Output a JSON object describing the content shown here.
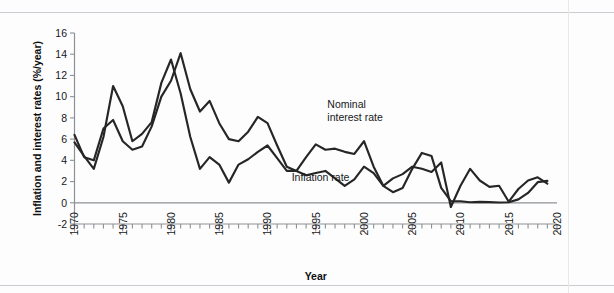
{
  "figure": {
    "background": "#fdfdfd",
    "line_color": "#262626",
    "axis_color": "#8d9196",
    "rule_color": "#c9ccd1"
  },
  "chart_data": {
    "type": "line",
    "title": "",
    "xlabel": "Year",
    "ylabel": "Inflation and interest rates (%/year)",
    "xlim": [
      1970,
      2020
    ],
    "ylim": [
      -2,
      16
    ],
    "yticks": [
      -2,
      0,
      2,
      4,
      6,
      8,
      10,
      12,
      14,
      16
    ],
    "ytick_labels": [
      "-2",
      "0",
      "2",
      "4",
      "6",
      "8",
      "10",
      "12",
      "14",
      "16"
    ],
    "xticks": [
      1970,
      1971,
      1972,
      1973,
      1974,
      1975,
      1976,
      1977,
      1978,
      1979,
      1980,
      1981,
      1982,
      1983,
      1984,
      1985,
      1986,
      1987,
      1988,
      1989,
      1990,
      1991,
      1992,
      1993,
      1994,
      1995,
      1996,
      1997,
      1998,
      1999,
      2000,
      2001,
      2002,
      2003,
      2004,
      2005,
      2006,
      2007,
      2008,
      2009,
      2010,
      2011,
      2012,
      2013,
      2014,
      2015,
      2016,
      2017,
      2018,
      2019,
      2020
    ],
    "xtick_labels_major": [
      "1970",
      "1975",
      "1980",
      "1985",
      "1990",
      "1995",
      "2000",
      "2005",
      "2010",
      "2015",
      "2020"
    ],
    "xtick_major_values": [
      1970,
      1975,
      1980,
      1985,
      1990,
      1995,
      2000,
      2005,
      2010,
      2015,
      2020
    ],
    "grid": false,
    "legend_position": "inline-annotations",
    "zero_line": 0,
    "x": [
      1970,
      1971,
      1972,
      1973,
      1974,
      1975,
      1976,
      1977,
      1978,
      1979,
      1980,
      1981,
      1982,
      1983,
      1984,
      1985,
      1986,
      1987,
      1988,
      1989,
      1990,
      1991,
      1992,
      1993,
      1994,
      1995,
      1996,
      1997,
      1998,
      1999,
      2000,
      2001,
      2002,
      2003,
      2004,
      2005,
      2006,
      2007,
      2008,
      2009,
      2010,
      2011,
      2012,
      2013,
      2014,
      2015,
      2016,
      2017,
      2018,
      2019
    ],
    "series": [
      {
        "name": "Nominal interest rate",
        "label": "Nominal\ninterest rate",
        "values": [
          6.4,
          4.3,
          4.0,
          7.0,
          7.8,
          5.8,
          5.0,
          5.3,
          7.2,
          10.0,
          11.5,
          14.1,
          10.7,
          8.6,
          9.6,
          7.5,
          6.0,
          5.8,
          6.7,
          8.1,
          7.5,
          5.4,
          3.4,
          3.0,
          4.3,
          5.5,
          5.0,
          5.1,
          4.8,
          4.6,
          5.8,
          3.4,
          1.6,
          1.0,
          1.4,
          3.2,
          4.7,
          4.4,
          1.4,
          0.15,
          0.14,
          0.05,
          0.09,
          0.06,
          0.03,
          0.05,
          0.32,
          0.93,
          1.94,
          2.06
        ],
        "points": [
          {
            "x": 1970,
            "y": 6.4
          },
          {
            "x": 1971,
            "y": 4.3
          },
          {
            "x": 1972,
            "y": 4.0
          },
          {
            "x": 1973,
            "y": 7.0
          },
          {
            "x": 1974,
            "y": 7.8
          },
          {
            "x": 1975,
            "y": 5.8
          },
          {
            "x": 1976,
            "y": 5.0
          },
          {
            "x": 1977,
            "y": 5.3
          },
          {
            "x": 1978,
            "y": 7.2
          },
          {
            "x": 1979,
            "y": 10.0
          },
          {
            "x": 1980,
            "y": 11.5
          },
          {
            "x": 1981,
            "y": 14.1
          },
          {
            "x": 1982,
            "y": 10.7
          },
          {
            "x": 1983,
            "y": 8.6
          },
          {
            "x": 1984,
            "y": 9.6
          },
          {
            "x": 1985,
            "y": 7.5
          },
          {
            "x": 1986,
            "y": 6.0
          },
          {
            "x": 1987,
            "y": 5.8
          },
          {
            "x": 1988,
            "y": 6.7
          },
          {
            "x": 1989,
            "y": 8.1
          },
          {
            "x": 1990,
            "y": 7.5
          },
          {
            "x": 1991,
            "y": 5.4
          },
          {
            "x": 1992,
            "y": 3.4
          },
          {
            "x": 1993,
            "y": 3.0
          },
          {
            "x": 1994,
            "y": 4.3
          },
          {
            "x": 1995,
            "y": 5.5
          },
          {
            "x": 1996,
            "y": 5.0
          },
          {
            "x": 1997,
            "y": 5.1
          },
          {
            "x": 1998,
            "y": 4.8
          },
          {
            "x": 1999,
            "y": 4.6
          },
          {
            "x": 2000,
            "y": 5.8
          },
          {
            "x": 2001,
            "y": 3.4
          },
          {
            "x": 2002,
            "y": 1.6
          },
          {
            "x": 2003,
            "y": 1.0
          },
          {
            "x": 2004,
            "y": 1.4
          },
          {
            "x": 2005,
            "y": 3.2
          },
          {
            "x": 2006,
            "y": 4.7
          },
          {
            "x": 2007,
            "y": 4.4
          },
          {
            "x": 2008,
            "y": 1.4
          },
          {
            "x": 2009,
            "y": 0.15
          },
          {
            "x": 2010,
            "y": 0.14
          },
          {
            "x": 2011,
            "y": 0.05
          },
          {
            "x": 2012,
            "y": 0.09
          },
          {
            "x": 2013,
            "y": 0.06
          },
          {
            "x": 2014,
            "y": 0.03
          },
          {
            "x": 2015,
            "y": 0.05
          },
          {
            "x": 2016,
            "y": 0.32
          },
          {
            "x": 2017,
            "y": 0.93
          },
          {
            "x": 2018,
            "y": 1.94
          },
          {
            "x": 2019,
            "y": 2.06
          }
        ]
      },
      {
        "name": "Inflation rate",
        "label": "Inflation rate",
        "values": [
          5.7,
          4.4,
          3.2,
          6.2,
          11.0,
          9.1,
          5.8,
          6.5,
          7.6,
          11.3,
          13.5,
          10.3,
          6.2,
          3.2,
          4.3,
          3.6,
          1.9,
          3.6,
          4.1,
          4.8,
          5.4,
          4.2,
          3.0,
          3.0,
          2.6,
          2.8,
          3.0,
          2.3,
          1.6,
          2.2,
          3.4,
          2.8,
          1.6,
          2.3,
          2.7,
          3.4,
          3.2,
          2.9,
          3.8,
          -0.4,
          1.6,
          3.2,
          2.1,
          1.5,
          1.6,
          0.1,
          1.3,
          2.1,
          2.4,
          1.8
        ],
        "points": [
          {
            "x": 1970,
            "y": 5.7
          },
          {
            "x": 1971,
            "y": 4.4
          },
          {
            "x": 1972,
            "y": 3.2
          },
          {
            "x": 1973,
            "y": 6.2
          },
          {
            "x": 1974,
            "y": 11.0
          },
          {
            "x": 1975,
            "y": 9.1
          },
          {
            "x": 1976,
            "y": 5.8
          },
          {
            "x": 1977,
            "y": 6.5
          },
          {
            "x": 1978,
            "y": 7.6
          },
          {
            "x": 1979,
            "y": 11.3
          },
          {
            "x": 1980,
            "y": 13.5
          },
          {
            "x": 1981,
            "y": 10.3
          },
          {
            "x": 1982,
            "y": 6.2
          },
          {
            "x": 1983,
            "y": 3.2
          },
          {
            "x": 1984,
            "y": 4.3
          },
          {
            "x": 1985,
            "y": 3.6
          },
          {
            "x": 1986,
            "y": 1.9
          },
          {
            "x": 1987,
            "y": 3.6
          },
          {
            "x": 1988,
            "y": 4.1
          },
          {
            "x": 1989,
            "y": 4.8
          },
          {
            "x": 1990,
            "y": 5.4
          },
          {
            "x": 1991,
            "y": 4.2
          },
          {
            "x": 1992,
            "y": 3.0
          },
          {
            "x": 1993,
            "y": 3.0
          },
          {
            "x": 1994,
            "y": 2.6
          },
          {
            "x": 1995,
            "y": 2.8
          },
          {
            "x": 1996,
            "y": 3.0
          },
          {
            "x": 1997,
            "y": 2.3
          },
          {
            "x": 1998,
            "y": 1.6
          },
          {
            "x": 1999,
            "y": 2.2
          },
          {
            "x": 2000,
            "y": 3.4
          },
          {
            "x": 2001,
            "y": 2.8
          },
          {
            "x": 2002,
            "y": 1.6
          },
          {
            "x": 2003,
            "y": 2.3
          },
          {
            "x": 2004,
            "y": 2.7
          },
          {
            "x": 2005,
            "y": 3.4
          },
          {
            "x": 2006,
            "y": 3.2
          },
          {
            "x": 2007,
            "y": 2.9
          },
          {
            "x": 2008,
            "y": 3.8
          },
          {
            "x": 2009,
            "y": -0.4
          },
          {
            "x": 2010,
            "y": 1.6
          },
          {
            "x": 2011,
            "y": 3.2
          },
          {
            "x": 2012,
            "y": 2.1
          },
          {
            "x": 2013,
            "y": 1.5
          },
          {
            "x": 2014,
            "y": 1.6
          },
          {
            "x": 2015,
            "y": 0.1
          },
          {
            "x": 2016,
            "y": 1.3
          },
          {
            "x": 2017,
            "y": 2.1
          },
          {
            "x": 2018,
            "y": 2.4
          },
          {
            "x": 2019,
            "y": 1.8
          }
        ]
      }
    ],
    "annotations": [
      {
        "name": "nominal-interest-rate-label",
        "line1": "Nominal",
        "line2": "interest rate",
        "x": 1996.2,
        "y": 8.9
      },
      {
        "name": "inflation-rate-label",
        "line1": "Inflation rate",
        "line2": "",
        "x": 1992.5,
        "y": 2.05
      }
    ]
  }
}
